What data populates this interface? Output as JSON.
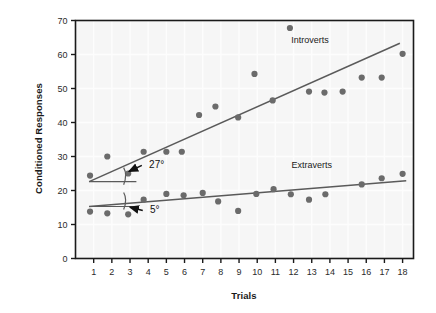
{
  "chart_data": {
    "type": "scatter",
    "title": "",
    "xlabel": "Trials",
    "ylabel": "Conditioned Responses",
    "xlim": [
      0,
      18.6
    ],
    "ylim": [
      0,
      70
    ],
    "xticks": [
      1,
      2,
      3,
      4,
      5,
      6,
      7,
      8,
      9,
      10,
      11,
      12,
      13,
      14,
      15,
      16,
      17,
      18
    ],
    "yticks": [
      0,
      10,
      20,
      30,
      40,
      50,
      60,
      70
    ],
    "grid": true,
    "legend_position": "inline-right",
    "point_color": "#6b6b6b",
    "line_color": "#5a5a5a",
    "axis_color": "#1a1a1a",
    "grid_color": "#fdfdfd",
    "plot_background": "#f6f6f6",
    "series": [
      {
        "name": "Introverts",
        "label_x": 12.9,
        "label_y": 63.5,
        "points": [
          {
            "x": 0.8,
            "y": 24.4
          },
          {
            "x": 1.75,
            "y": 30.0
          },
          {
            "x": 2.9,
            "y": 25.0
          },
          {
            "x": 3.75,
            "y": 31.4
          },
          {
            "x": 5.0,
            "y": 31.4
          },
          {
            "x": 5.85,
            "y": 31.4
          },
          {
            "x": 6.8,
            "y": 42.2
          },
          {
            "x": 7.7,
            "y": 44.7
          },
          {
            "x": 8.95,
            "y": 41.5
          },
          {
            "x": 9.85,
            "y": 54.3
          },
          {
            "x": 10.85,
            "y": 46.5
          },
          {
            "x": 11.8,
            "y": 67.8
          },
          {
            "x": 12.85,
            "y": 49.1
          },
          {
            "x": 13.7,
            "y": 48.8
          },
          {
            "x": 14.7,
            "y": 49.1
          },
          {
            "x": 15.75,
            "y": 53.2
          },
          {
            "x": 16.85,
            "y": 53.2
          },
          {
            "x": 18.0,
            "y": 60.2
          }
        ],
        "trendline": {
          "x1": 0.75,
          "y1": 22.6,
          "x2": 17.85,
          "y2": 63.3
        }
      },
      {
        "name": "Extraverts",
        "label_x": 13.0,
        "label_y": 26.5,
        "points": [
          {
            "x": 0.8,
            "y": 13.8
          },
          {
            "x": 1.75,
            "y": 13.3
          },
          {
            "x": 2.9,
            "y": 13.0
          },
          {
            "x": 3.75,
            "y": 17.3
          },
          {
            "x": 5.0,
            "y": 19.0
          },
          {
            "x": 5.95,
            "y": 18.6
          },
          {
            "x": 7.0,
            "y": 19.3
          },
          {
            "x": 7.85,
            "y": 16.8
          },
          {
            "x": 8.95,
            "y": 14.0
          },
          {
            "x": 9.95,
            "y": 19.0
          },
          {
            "x": 10.9,
            "y": 20.4
          },
          {
            "x": 11.85,
            "y": 18.9
          },
          {
            "x": 12.85,
            "y": 17.3
          },
          {
            "x": 13.75,
            "y": 18.9
          },
          {
            "x": 15.75,
            "y": 21.8
          },
          {
            "x": 16.85,
            "y": 23.6
          },
          {
            "x": 18.0,
            "y": 24.9
          }
        ],
        "trendline": {
          "x1": 0.75,
          "y1": 15.3,
          "x2": 18.2,
          "y2": 22.9
        }
      }
    ],
    "annotations": [
      {
        "name": "introverts-angle",
        "text": "27°",
        "text_x": 4.05,
        "text_y": 26.6,
        "arrow_from_x": 3.65,
        "arrow_from_y": 27.4,
        "arrow_to_x": 2.95,
        "arrow_to_y": 25.6,
        "ref_line": {
          "x1": 0.75,
          "y1": 22.6,
          "x2": 3.35,
          "y2": 22.6
        },
        "arc_cx": 0.75,
        "arc_cy": 22.6,
        "arc_r_x": 1.9
      },
      {
        "name": "extraverts-angle",
        "text": "5°",
        "text_x": 4.1,
        "text_y": 13.3,
        "arrow_from_x": 3.7,
        "arrow_from_y": 14.1,
        "arrow_to_x": 3.0,
        "arrow_to_y": 15.1,
        "ref_line": {
          "x1": 0.75,
          "y1": 15.3,
          "x2": 3.3,
          "y2": 15.3
        },
        "arc_cx": 0.75,
        "arc_cy": 15.3,
        "arc_r_x": 1.9
      }
    ]
  }
}
